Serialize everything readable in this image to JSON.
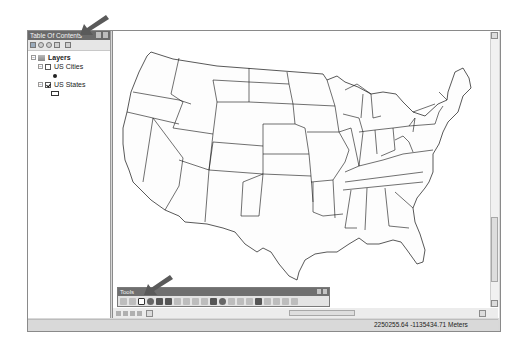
{
  "toc": {
    "title": "Table Of Contents",
    "toolbar_icons": [
      "list-by-drawing-order-icon",
      "list-by-source-icon",
      "list-by-visibility-icon",
      "list-by-selection-icon",
      "options-icon"
    ],
    "root": {
      "label": "Layers",
      "expanded": true
    },
    "layers": [
      {
        "label": "US Cities",
        "checked": false,
        "symbol": "point"
      },
      {
        "label": "US States",
        "checked": true,
        "symbol": "polygon"
      }
    ]
  },
  "tools_toolbar": {
    "title": "Tools",
    "buttons": [
      "zoom-in",
      "zoom-out",
      "pan",
      "full-extent",
      "fixed-zoom-in",
      "fixed-zoom-out",
      "go-back",
      "go-forward",
      "select-features",
      "clear-selection",
      "select-elements",
      "identify",
      "hyperlink",
      "html-popup",
      "measure",
      "find",
      "find-route",
      "go-to-xy",
      "time-slider",
      "create-viewer"
    ],
    "selected": "pan"
  },
  "map": {
    "content": "Contiguous United States state boundaries"
  },
  "status_bar": {
    "coordinates": "2250255.64  -1135434.71 Meters"
  },
  "annotations": {
    "arrow_color": "#5a5a5a"
  }
}
